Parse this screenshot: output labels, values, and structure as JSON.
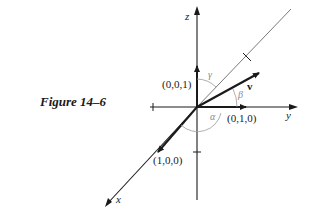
{
  "figure": {
    "caption": "Figure 14–6",
    "axes": {
      "x_label": "x",
      "y_label": "y",
      "z_label": "z"
    },
    "unit_vectors": {
      "i": "(1,0,0)",
      "j": "(0,1,0)",
      "k": "(0,0,1)"
    },
    "vector_label": "v",
    "angles": {
      "alpha": "α",
      "beta": "β",
      "gamma": "γ"
    },
    "colors": {
      "ink": "#1a1a1a",
      "thin_line": "#555555",
      "arc": "#9a9a9a"
    }
  }
}
